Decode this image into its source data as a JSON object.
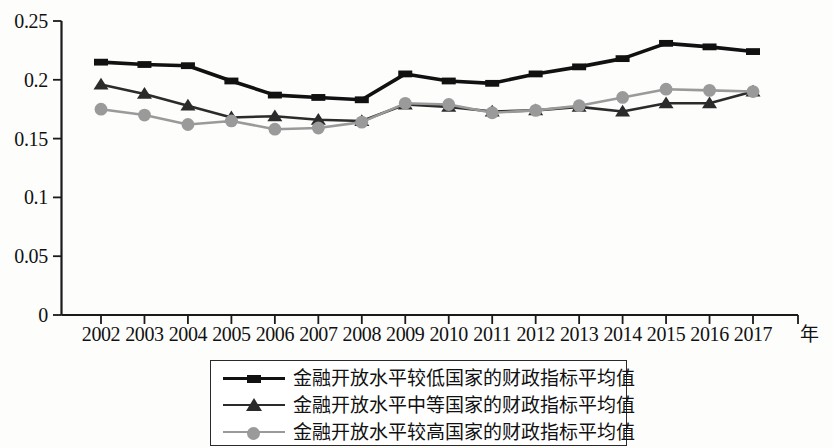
{
  "chart_data": {
    "type": "line",
    "title": "",
    "xlabel": "年",
    "ylabel": "",
    "categories": [
      "2002",
      "2003",
      "2004",
      "2005",
      "2006",
      "2007",
      "2008",
      "2009",
      "2010",
      "2011",
      "2012",
      "2013",
      "2014",
      "2015",
      "2016",
      "2017"
    ],
    "x": [
      2002,
      2003,
      2004,
      2005,
      2006,
      2007,
      2008,
      2009,
      2010,
      2011,
      2012,
      2013,
      2014,
      2015,
      2016,
      2017
    ],
    "ylim": [
      0,
      0.25
    ],
    "xlim": [
      2002,
      2017
    ],
    "y_ticks": [
      "0",
      "0.05",
      "0.1",
      "0.15",
      "0.2",
      "0.25"
    ],
    "y_tick_values": [
      0,
      0.05,
      0.1,
      0.15,
      0.2,
      0.25
    ],
    "grid": false,
    "legend_position": "bottom",
    "series": [
      {
        "name": "金融开放水平较低国家的财政指标平均值",
        "marker": "square",
        "color": "#111111",
        "values": [
          0.215,
          0.213,
          0.212,
          0.199,
          0.187,
          0.185,
          0.183,
          0.205,
          0.199,
          0.197,
          0.205,
          0.211,
          0.218,
          0.231,
          0.228,
          0.224
        ]
      },
      {
        "name": "金融开放水平中等国家的财政指标平均值",
        "marker": "triangle",
        "color": "#2b2b2b",
        "values": [
          0.196,
          0.188,
          0.178,
          0.168,
          0.169,
          0.166,
          0.165,
          0.179,
          0.177,
          0.173,
          0.174,
          0.177,
          0.173,
          0.18,
          0.18,
          0.19
        ]
      },
      {
        "name": "金融开放水平较高国家的财政指标平均值",
        "marker": "circle",
        "color": "#9a9a9a",
        "values": [
          0.175,
          0.17,
          0.162,
          0.165,
          0.158,
          0.159,
          0.164,
          0.18,
          0.179,
          0.172,
          0.174,
          0.178,
          0.185,
          0.192,
          0.191,
          0.19
        ]
      }
    ]
  },
  "axis": {
    "y_labels": [
      "0.25",
      "0.2",
      "0.15",
      "0.1",
      "0.05",
      "0"
    ],
    "x_labels": [
      "2002",
      "2003",
      "2004",
      "2005",
      "2006",
      "2007",
      "2008",
      "2009",
      "2010",
      "2011",
      "2012",
      "2013",
      "2014",
      "2015",
      "2016",
      "2017"
    ],
    "x_unit": "年"
  },
  "legend": {
    "items": [
      {
        "label": "金融开放水平较低国家的财政指标平均值",
        "marker": "square-marker",
        "color": "#111111"
      },
      {
        "label": "金融开放水平中等国家的财政指标平均值",
        "marker": "triangle-marker",
        "color": "#2b2b2b"
      },
      {
        "label": "金融开放水平较高国家的财政指标平均值",
        "marker": "circle-marker",
        "color": "#9a9a9a"
      }
    ]
  }
}
